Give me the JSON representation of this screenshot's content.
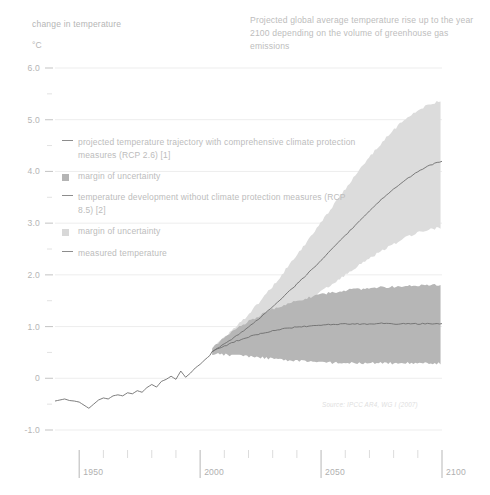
{
  "axis_caption": "change in temperature",
  "unit_caption": "°C",
  "title": "Projected global average temperature rise up to the year 2100 depending on the volume of greenhouse gas emissions",
  "source": "Source: IPCC AR4, WG I (2007)",
  "legend": [
    {
      "marker": "line",
      "label": "projected temperature trajectory with comprehensive climate protection measures (RCP 2.6) [1]"
    },
    {
      "marker": "swatch-dark",
      "label": "margin of uncertainty"
    },
    {
      "marker": "line",
      "label": "temperature development without climate protection measures (RCP 8.5) [2]"
    },
    {
      "marker": "swatch-light",
      "label": "margin of uncertainty"
    },
    {
      "marker": "line",
      "label": "measured temperature"
    }
  ],
  "colors": {
    "line": "#6e6e6e",
    "band_rcp26": "#b6b6b6",
    "band_rcp85": "#dcdcdc",
    "grid": "#ededed",
    "tick": "#c9c9c9",
    "text": "#bababa"
  },
  "chart_data": {
    "type": "area",
    "title": "Projected global average temperature rise up to the year 2100 depending on the volume of greenhouse gas emissions",
    "xlabel": "",
    "ylabel": "change in temperature (°C)",
    "xlim": [
      1940,
      2100
    ],
    "ylim": [
      -1.0,
      6.0
    ],
    "grid": true,
    "legend_position": "inside-upper-left",
    "x_ticks_major": [
      1950,
      2000,
      2050,
      2100
    ],
    "x_ticks_minor_step": 10,
    "y_ticks_major": [
      -1.0,
      0,
      1.0,
      2.0,
      3.0,
      4.0,
      5.0,
      6.0
    ],
    "y_ticks_major_labels": [
      "-1.0",
      "0",
      "1.0",
      "2.0",
      "3.0",
      "4.0",
      "5.0",
      "6.0"
    ],
    "y_ticks_minor_step": 0.5,
    "series": [
      {
        "name": "measured temperature",
        "kind": "line",
        "x": [
          1940,
          1942,
          1944,
          1946,
          1948,
          1950,
          1952,
          1954,
          1956,
          1958,
          1960,
          1962,
          1964,
          1966,
          1968,
          1970,
          1972,
          1974,
          1976,
          1978,
          1980,
          1982,
          1984,
          1986,
          1988,
          1990,
          1992,
          1994,
          1996,
          1998,
          2000,
          2002,
          2004,
          2005
        ],
        "values": [
          -0.44,
          -0.42,
          -0.4,
          -0.43,
          -0.44,
          -0.46,
          -0.52,
          -0.58,
          -0.5,
          -0.42,
          -0.38,
          -0.4,
          -0.34,
          -0.32,
          -0.34,
          -0.28,
          -0.3,
          -0.24,
          -0.27,
          -0.18,
          -0.12,
          -0.17,
          -0.06,
          -0.02,
          0.04,
          -0.02,
          0.14,
          0.02,
          0.1,
          0.2,
          0.27,
          0.36,
          0.44,
          0.52
        ]
      },
      {
        "name": "projected temperature trajectory with comprehensive climate protection measures (RCP 2.6)",
        "kind": "line",
        "x": [
          2005,
          2010,
          2015,
          2020,
          2025,
          2030,
          2035,
          2040,
          2045,
          2050,
          2055,
          2060,
          2065,
          2070,
          2075,
          2080,
          2085,
          2090,
          2095,
          2100
        ],
        "values": [
          0.52,
          0.62,
          0.72,
          0.8,
          0.86,
          0.92,
          0.96,
          0.99,
          1.01,
          1.03,
          1.04,
          1.05,
          1.05,
          1.05,
          1.06,
          1.05,
          1.06,
          1.05,
          1.06,
          1.05
        ]
      },
      {
        "name": "margin of uncertainty (RCP 2.6)",
        "kind": "band",
        "x": [
          2005,
          2010,
          2015,
          2020,
          2025,
          2030,
          2035,
          2040,
          2045,
          2050,
          2055,
          2060,
          2065,
          2070,
          2075,
          2080,
          2085,
          2090,
          2095,
          2100
        ],
        "lower": [
          0.47,
          0.46,
          0.44,
          0.42,
          0.4,
          0.38,
          0.36,
          0.34,
          0.32,
          0.31,
          0.3,
          0.3,
          0.29,
          0.29,
          0.29,
          0.29,
          0.29,
          0.29,
          0.29,
          0.29
        ],
        "upper": [
          0.58,
          0.78,
          0.96,
          1.1,
          1.22,
          1.33,
          1.42,
          1.5,
          1.56,
          1.62,
          1.66,
          1.7,
          1.72,
          1.74,
          1.76,
          1.77,
          1.78,
          1.79,
          1.8,
          1.8
        ]
      },
      {
        "name": "temperature development without climate protection measures (RCP 8.5)",
        "kind": "line",
        "x": [
          2005,
          2010,
          2015,
          2020,
          2025,
          2030,
          2035,
          2040,
          2045,
          2050,
          2055,
          2060,
          2065,
          2070,
          2075,
          2080,
          2085,
          2090,
          2095,
          2100
        ],
        "values": [
          0.52,
          0.66,
          0.82,
          0.99,
          1.18,
          1.38,
          1.6,
          1.82,
          2.05,
          2.28,
          2.52,
          2.76,
          3.0,
          3.24,
          3.46,
          3.66,
          3.84,
          4.0,
          4.12,
          4.2
        ]
      },
      {
        "name": "margin of uncertainty (RCP 8.5)",
        "kind": "band",
        "x": [
          2005,
          2010,
          2015,
          2020,
          2025,
          2030,
          2035,
          2040,
          2045,
          2050,
          2055,
          2060,
          2065,
          2070,
          2075,
          2080,
          2085,
          2090,
          2095,
          2100
        ],
        "lower": [
          0.47,
          0.56,
          0.68,
          0.8,
          0.93,
          1.07,
          1.22,
          1.37,
          1.52,
          1.68,
          1.84,
          2.0,
          2.16,
          2.32,
          2.46,
          2.6,
          2.72,
          2.82,
          2.88,
          2.92
        ],
        "upper": [
          0.58,
          0.78,
          1.0,
          1.24,
          1.5,
          1.78,
          2.08,
          2.38,
          2.7,
          3.02,
          3.34,
          3.66,
          3.98,
          4.28,
          4.55,
          4.8,
          5.02,
          5.18,
          5.3,
          5.38
        ]
      }
    ]
  }
}
